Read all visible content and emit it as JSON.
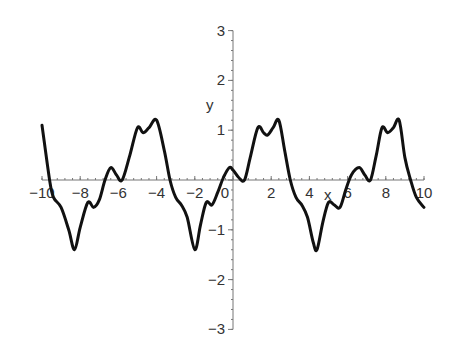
{
  "chart_data": {
    "type": "line",
    "title": "",
    "xlabel": "x",
    "ylabel": "y",
    "xlim": [
      -10,
      10
    ],
    "ylim": [
      -3,
      3
    ],
    "grid": false,
    "legend": null,
    "x_ticks": [
      "-10",
      "-8",
      "-6",
      "-4",
      "-2",
      "0",
      "2",
      "4",
      "6",
      "8",
      "10"
    ],
    "y_ticks": [
      "-3",
      "-2",
      "-1",
      "1",
      "2",
      "3"
    ],
    "series": [
      {
        "name": "y(x)",
        "color": "#111111",
        "period": 6.2832,
        "x": [
          -10.0,
          -9.6,
          -9.4,
          -9.0,
          -8.6,
          -8.3,
          -8.0,
          -7.6,
          -7.3,
          -7.0,
          -6.7,
          -6.4,
          -6.1,
          -5.8,
          -5.4,
          -5.0,
          -4.7,
          -4.4,
          -4.0,
          -3.6,
          -3.3,
          -3.0,
          -2.7,
          -2.4,
          -2.0,
          -1.7,
          -1.4,
          -1.1,
          -0.8,
          -0.5,
          -0.2,
          0.0,
          0.3,
          0.6,
          0.9,
          1.3,
          1.6,
          1.8,
          2.1,
          2.4,
          2.7,
          3.0,
          3.3,
          3.6,
          3.9,
          4.2,
          4.4,
          4.7,
          5.0,
          5.3,
          5.6,
          5.9,
          6.2,
          6.6,
          6.9,
          7.2,
          7.5,
          7.8,
          8.1,
          8.4,
          8.7,
          9.0,
          9.3,
          9.6,
          10.0
        ],
        "y": [
          1.1,
          0.0,
          -0.35,
          -0.55,
          -1.0,
          -1.4,
          -0.95,
          -0.45,
          -0.55,
          -0.4,
          0.0,
          0.25,
          0.1,
          0.0,
          0.5,
          1.05,
          0.95,
          1.05,
          1.2,
          0.6,
          0.0,
          -0.35,
          -0.5,
          -0.75,
          -1.4,
          -0.9,
          -0.45,
          -0.5,
          -0.25,
          0.05,
          0.25,
          0.2,
          0.05,
          0.0,
          0.45,
          1.05,
          0.95,
          0.9,
          1.05,
          1.2,
          0.6,
          0.0,
          -0.35,
          -0.5,
          -0.75,
          -1.25,
          -1.4,
          -0.85,
          -0.45,
          -0.5,
          -0.55,
          -0.2,
          0.1,
          0.25,
          0.1,
          0.0,
          0.5,
          1.05,
          0.95,
          1.05,
          1.2,
          0.45,
          0.0,
          -0.35,
          -0.55
        ]
      }
    ]
  }
}
